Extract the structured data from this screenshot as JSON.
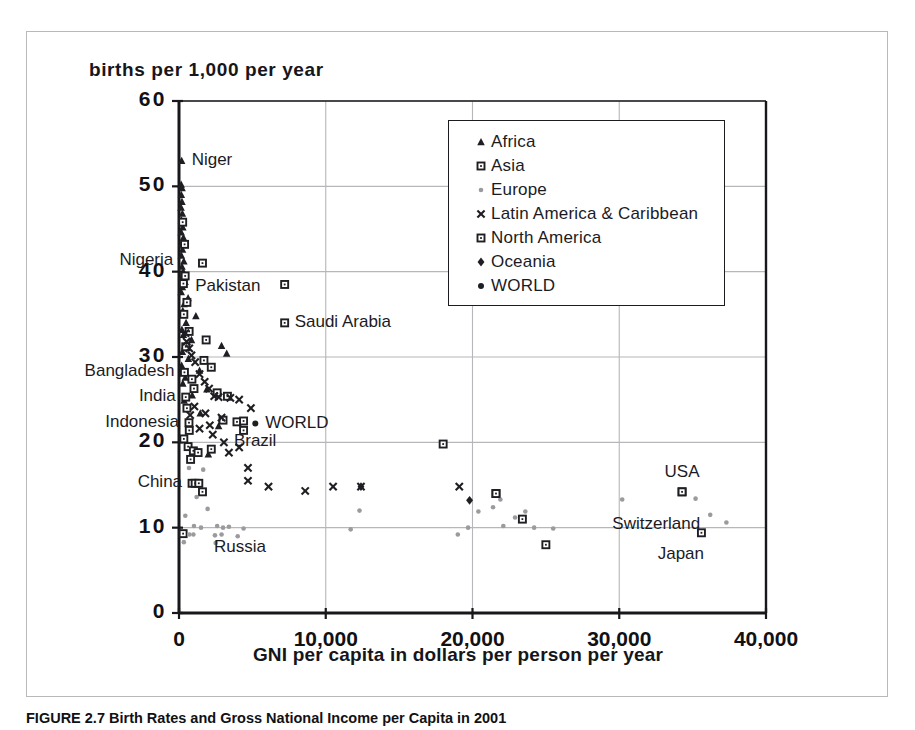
{
  "figure": {
    "caption": "FIGURE 2.7 Birth Rates and Gross National Income per Capita in 2001"
  },
  "chart_data": {
    "type": "scatter",
    "title": "",
    "xlabel": "GNI per capita in dollars per person per year",
    "ylabel": "births per 1,000 per year",
    "xlim": [
      0,
      40000
    ],
    "ylim": [
      0,
      60
    ],
    "xticks": [
      0,
      10000,
      20000,
      30000,
      40000
    ],
    "xticklabels": [
      "0",
      "10,000",
      "20,000",
      "30,000",
      "40,000"
    ],
    "yticks": [
      0,
      10,
      20,
      30,
      40,
      50,
      60
    ],
    "yticklabels": [
      "0",
      "10",
      "20",
      "30",
      "40",
      "50",
      "60"
    ],
    "grid": true,
    "legend_position": "upper-center-right",
    "legend": [
      {
        "name": "Africa",
        "marker": "triangle",
        "color": "#1f1f23"
      },
      {
        "name": "Asia",
        "marker": "open-square",
        "color": "#1f1f23"
      },
      {
        "name": "Europe",
        "marker": "small-dot",
        "color": "#9a9a9f"
      },
      {
        "name": "Latin America & Caribbean",
        "marker": "x-cross",
        "color": "#1f1f23"
      },
      {
        "name": "North America",
        "marker": "open-square",
        "color": "#1f1f23"
      },
      {
        "name": "Oceania",
        "marker": "diamond",
        "color": "#1f1f23"
      },
      {
        "name": "WORLD",
        "marker": "dot",
        "color": "#1f1f23"
      }
    ],
    "annotations": [
      {
        "label": "Niger",
        "x": 180,
        "y": 53.0,
        "anchor": "right"
      },
      {
        "label": "Nigeria",
        "x": 290,
        "y": 41.2,
        "anchor": "left"
      },
      {
        "label": "Pakistan",
        "x": 420,
        "y": 38.2,
        "anchor": "right"
      },
      {
        "label": "Saudi Arabia",
        "x": 7200,
        "y": 34.0,
        "anchor": "right"
      },
      {
        "label": "Bangladesh",
        "x": 370,
        "y": 28.2,
        "anchor": "left"
      },
      {
        "label": "India",
        "x": 460,
        "y": 25.3,
        "anchor": "left"
      },
      {
        "label": "Indonesia",
        "x": 680,
        "y": 22.3,
        "anchor": "left"
      },
      {
        "label": "WORLD",
        "x": 5200,
        "y": 22.2,
        "anchor": "right"
      },
      {
        "label": "Brazil",
        "x": 3060,
        "y": 20.0,
        "anchor": "right"
      },
      {
        "label": "China",
        "x": 890,
        "y": 15.2,
        "anchor": "left"
      },
      {
        "label": "USA",
        "x": 34280,
        "y": 14.2,
        "anchor": "above"
      },
      {
        "label": "Switzerland",
        "x": 36200,
        "y": 10.3,
        "anchor": "left"
      },
      {
        "label": "Japan",
        "x": 34200,
        "y": 9.3,
        "anchor": "below"
      },
      {
        "label": "Russia",
        "x": 1700,
        "y": 7.6,
        "anchor": "right"
      }
    ],
    "series": [
      {
        "name": "Africa",
        "marker": "triangle",
        "color": "#1f1f23",
        "points": [
          [
            180,
            53.0
          ],
          [
            150,
            50.2
          ],
          [
            210,
            49.8
          ],
          [
            160,
            49.0
          ],
          [
            200,
            48.2
          ],
          [
            140,
            47.5
          ],
          [
            230,
            46.8
          ],
          [
            170,
            46.0
          ],
          [
            260,
            45.2
          ],
          [
            150,
            44.6
          ],
          [
            300,
            44.0
          ],
          [
            190,
            43.3
          ],
          [
            240,
            42.6
          ],
          [
            160,
            41.9
          ],
          [
            330,
            41.2
          ],
          [
            200,
            40.6
          ],
          [
            290,
            40.0
          ],
          [
            170,
            39.4
          ],
          [
            410,
            38.8
          ],
          [
            230,
            38.2
          ],
          [
            150,
            37.6
          ],
          [
            620,
            36.9
          ],
          [
            350,
            36.2
          ],
          [
            260,
            35.4
          ],
          [
            1150,
            34.8
          ],
          [
            480,
            34.0
          ],
          [
            200,
            33.2
          ],
          [
            300,
            32.6
          ],
          [
            850,
            32.0
          ],
          [
            400,
            31.3
          ],
          [
            230,
            30.6
          ],
          [
            2900,
            31.3
          ],
          [
            3250,
            30.4
          ],
          [
            640,
            29.8
          ],
          [
            180,
            29.0
          ],
          [
            1400,
            28.4
          ],
          [
            430,
            27.6
          ],
          [
            260,
            26.9
          ],
          [
            1900,
            26.2
          ],
          [
            900,
            25.5
          ],
          [
            350,
            24.9
          ],
          [
            1450,
            23.4
          ],
          [
            2700,
            21.9
          ],
          [
            2000,
            18.6
          ]
        ]
      },
      {
        "name": "Asia",
        "marker": "open-square",
        "color": "#1f1f23",
        "points": [
          [
            250,
            45.8
          ],
          [
            1600,
            41.0
          ],
          [
            380,
            43.2
          ],
          [
            420,
            39.5
          ],
          [
            300,
            38.6
          ],
          [
            7200,
            38.5
          ],
          [
            7200,
            34.0
          ],
          [
            540,
            36.4
          ],
          [
            330,
            35.0
          ],
          [
            690,
            33.0
          ],
          [
            1850,
            32.0
          ],
          [
            460,
            31.2
          ],
          [
            1700,
            29.6
          ],
          [
            370,
            28.2
          ],
          [
            2200,
            28.8
          ],
          [
            880,
            27.4
          ],
          [
            1020,
            26.3
          ],
          [
            460,
            25.3
          ],
          [
            2600,
            25.8
          ],
          [
            3300,
            25.4
          ],
          [
            540,
            24.0
          ],
          [
            680,
            22.3
          ],
          [
            700,
            21.4
          ],
          [
            3000,
            22.6
          ],
          [
            3950,
            22.4
          ],
          [
            4400,
            22.5
          ],
          [
            4400,
            21.4
          ],
          [
            330,
            20.4
          ],
          [
            620,
            19.5
          ],
          [
            980,
            19.0
          ],
          [
            1300,
            18.8
          ],
          [
            790,
            18.0
          ],
          [
            2200,
            19.2
          ],
          [
            18000,
            19.8
          ],
          [
            890,
            15.2
          ],
          [
            1100,
            15.2
          ],
          [
            1350,
            15.2
          ],
          [
            1600,
            14.2
          ],
          [
            21600,
            14.0
          ],
          [
            23400,
            11.0
          ],
          [
            25000,
            8.0
          ],
          [
            280,
            9.3
          ],
          [
            35600,
            9.4
          ],
          [
            34280,
            14.2
          ]
        ]
      },
      {
        "name": "Europe",
        "marker": "small-dot",
        "color": "#9a9a9f",
        "points": [
          [
            680,
            17.0
          ],
          [
            1650,
            16.8
          ],
          [
            1200,
            13.6
          ],
          [
            1950,
            12.2
          ],
          [
            430,
            11.4
          ],
          [
            1020,
            10.2
          ],
          [
            1500,
            10.0
          ],
          [
            2600,
            10.2
          ],
          [
            3000,
            10.0
          ],
          [
            3400,
            10.1
          ],
          [
            4400,
            9.9
          ],
          [
            700,
            9.2
          ],
          [
            980,
            9.2
          ],
          [
            2450,
            9.1
          ],
          [
            2900,
            9.2
          ],
          [
            4000,
            9.0
          ],
          [
            330,
            8.3
          ],
          [
            2500,
            8.2
          ],
          [
            11700,
            9.8
          ],
          [
            19000,
            9.2
          ],
          [
            12300,
            12.0
          ],
          [
            20400,
            11.9
          ],
          [
            21400,
            12.4
          ],
          [
            22900,
            11.2
          ],
          [
            22100,
            10.2
          ],
          [
            23600,
            11.9
          ],
          [
            24200,
            10.0
          ],
          [
            19700,
            10.0
          ],
          [
            25500,
            9.9
          ],
          [
            30200,
            13.3
          ],
          [
            35200,
            13.4
          ],
          [
            36200,
            11.5
          ],
          [
            37300,
            10.6
          ],
          [
            21900,
            13.3
          ]
        ]
      },
      {
        "name": "Latin America & Caribbean",
        "marker": "x-cross",
        "color": "#1f1f23",
        "points": [
          [
            440,
            32.8
          ],
          [
            520,
            31.8
          ],
          [
            700,
            31.0
          ],
          [
            850,
            30.2
          ],
          [
            1100,
            29.4
          ],
          [
            1400,
            28.0
          ],
          [
            1750,
            27.1
          ],
          [
            2050,
            26.3
          ],
          [
            2400,
            25.4
          ],
          [
            2700,
            25.3
          ],
          [
            3500,
            25.2
          ],
          [
            4100,
            25.0
          ],
          [
            4900,
            24.0
          ],
          [
            1800,
            23.4
          ],
          [
            2900,
            22.9
          ],
          [
            3060,
            20.0
          ],
          [
            4100,
            19.4
          ],
          [
            3400,
            18.8
          ],
          [
            4700,
            17.0
          ],
          [
            4700,
            15.5
          ],
          [
            6100,
            14.8
          ],
          [
            8600,
            14.3
          ],
          [
            10500,
            14.8
          ],
          [
            12400,
            14.8
          ],
          [
            19100,
            14.8
          ],
          [
            1050,
            24.2
          ],
          [
            1400,
            21.6
          ],
          [
            2100,
            22.0
          ],
          [
            760,
            23.2
          ],
          [
            2300,
            20.9
          ]
        ]
      },
      {
        "name": "North America",
        "marker": "open-square",
        "color": "#1f1f23",
        "points": [
          [
            34280,
            14.2
          ],
          [
            21600,
            14.0
          ]
        ]
      },
      {
        "name": "Oceania",
        "marker": "diamond",
        "color": "#1f1f23",
        "points": [
          [
            12400,
            14.8
          ],
          [
            19800,
            13.2
          ]
        ]
      },
      {
        "name": "WORLD",
        "marker": "dot",
        "color": "#1f1f23",
        "points": [
          [
            5200,
            22.2
          ]
        ]
      }
    ]
  }
}
